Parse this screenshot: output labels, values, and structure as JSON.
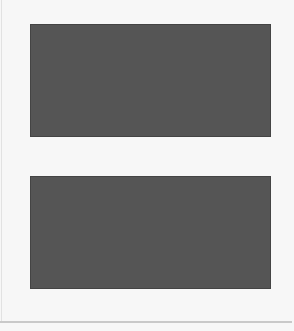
{
  "figure": {
    "top_grid": {
      "description": "photo collage tiles alternating with grey squares",
      "rows": [
        {
          "order": "image-first",
          "tiles": [
            "light",
            "light",
            "dark",
            "mixed",
            "light"
          ]
        },
        {
          "order": "square-first",
          "tiles": [
            "mixed",
            "light",
            "mixed",
            "light",
            "dark"
          ]
        },
        {
          "order": "image-first",
          "tiles": [
            "dark",
            "mixed",
            "light",
            "light",
            "mixed"
          ]
        },
        {
          "order": "square-first",
          "tiles": [
            "light",
            "mixed",
            "light",
            "dark",
            "light"
          ]
        },
        {
          "order": "image-first",
          "tiles": [
            "light",
            "dark",
            "light",
            "mixed",
            "mixed"
          ]
        },
        {
          "order": "square-first",
          "tiles": [
            "light",
            "light",
            "light",
            "light",
            "dark"
          ]
        },
        {
          "order": "image-first",
          "tiles": [
            "mixed",
            "light",
            "dark",
            "mixed",
            "light"
          ]
        }
      ],
      "colors": {
        "square": "#a9a9a9",
        "grout": "#555555"
      }
    },
    "bottom_grid": {
      "description": "abstract black/white/grey block pattern",
      "rows": [
        {
          "order": "black-first"
        },
        {
          "order": "white-first"
        },
        {
          "order": "black-first"
        },
        {
          "order": "white-first"
        },
        {
          "order": "black-first"
        },
        {
          "order": "white-first"
        },
        {
          "order": "black-first"
        }
      ],
      "blocks_per_row": 5,
      "colors": {
        "black": "#111111",
        "white": "#ffffff",
        "grey": "#c9c9c9"
      }
    }
  }
}
